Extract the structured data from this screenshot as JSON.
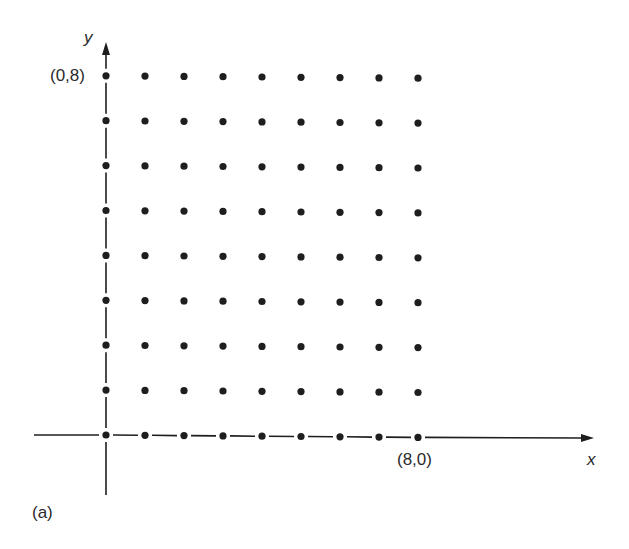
{
  "figure": {
    "panel_label": "(a)",
    "x_axis_label": "x",
    "y_axis_label": "y",
    "point_label_y": "(0,8)",
    "point_label_x": "(8,0)"
  },
  "lattice": {
    "x_min": 0,
    "x_max": 8,
    "y_min": 0,
    "y_max": 8,
    "origin_px": [
      106,
      435
    ],
    "step_x_px": 39,
    "step_y_px": 44.9,
    "dot_radius": 3.6,
    "color": "#1e1e1e"
  }
}
